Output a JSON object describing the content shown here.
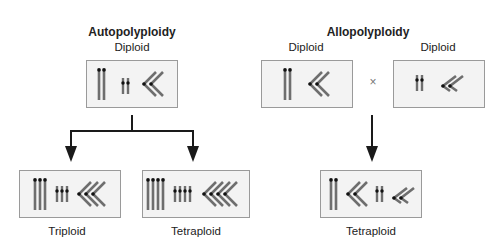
{
  "autopolyploidy": {
    "title": "Autopolyploidy",
    "parent_label": "Diploid",
    "children": [
      {
        "label": "Triploid",
        "ploidy": 3
      },
      {
        "label": "Tetraploid",
        "ploidy": 4
      }
    ]
  },
  "allopolyploidy": {
    "title": "Allopolyploidy",
    "parent_labels": [
      "Diploid",
      "Diploid"
    ],
    "cross_symbol": "×",
    "child_label": "Tetraploid"
  },
  "colors": {
    "chromosome": "#6e6e6e",
    "centromere": "#111111",
    "box_border": "#9a9a9a",
    "box_fill": "#f3f3f3",
    "arrow": "#1a1a1a"
  }
}
